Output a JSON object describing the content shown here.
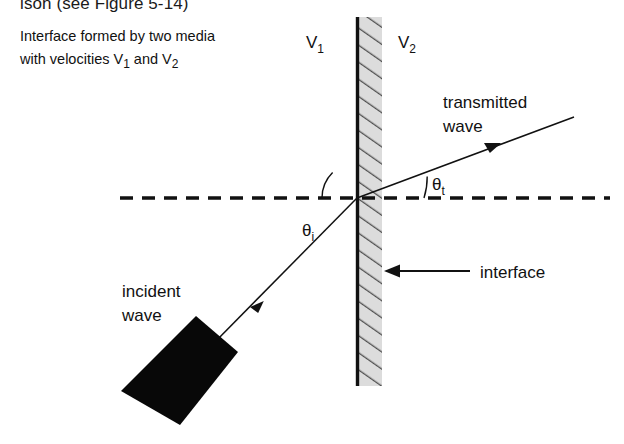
{
  "page": {
    "title_fragment": "ison (see Figure 5-14)",
    "background_color": "#ffffff",
    "ink_color": "#111111",
    "hatch_fill_color": "#d9d9d9",
    "hatch_line_color": "#4a4a4a"
  },
  "caption": {
    "line1": "Interface formed by two media",
    "line2_prefix": "with velocities V",
    "line2_sub1": "1",
    "line2_mid": " and V",
    "line2_sub2": "2"
  },
  "media": {
    "left": {
      "symbol": "V",
      "subscript": "1"
    },
    "right": {
      "symbol": "V",
      "subscript": "2"
    }
  },
  "angles": {
    "incident": {
      "symbol": "θ",
      "subscript": "i"
    },
    "transmitted": {
      "symbol": "θ",
      "subscript": "t"
    }
  },
  "labels": {
    "transmitted_wave_line1": "transmitted",
    "transmitted_wave_line2": "wave",
    "incident_wave_line1": "incident",
    "incident_wave_line2": "wave",
    "interface": "interface"
  },
  "geometry": {
    "interface_x": 357,
    "interface_top_y": 17,
    "interface_bottom_y": 386,
    "hatch_band_width": 23,
    "normal_dash_y": 198,
    "normal_dash_x_start": 120,
    "normal_dash_x_end": 610,
    "intersection": [
      357,
      198
    ],
    "incident_ray_start": [
      212,
      345
    ],
    "transmitted_ray_end": [
      574,
      117
    ],
    "interface_arrow_tip": [
      384,
      271
    ],
    "interface_arrow_tail": [
      470,
      271
    ],
    "transducer_corners": "196,316 238,352 180,425 121,391"
  }
}
